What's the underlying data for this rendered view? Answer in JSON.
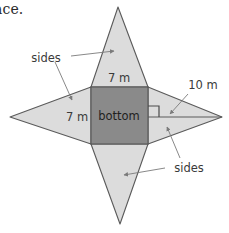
{
  "page": {
    "partial_text_top_left": "ace.",
    "background_color": "#ffffff"
  },
  "figure": {
    "colors": {
      "base_fill": "#8a8a8a",
      "side_fill": "#dcdcdc",
      "outline": "#5a5a5a",
      "leader_line": "#7a7a7a",
      "text": "#3a3a3a"
    },
    "base_label": "bottom",
    "labels": {
      "top_width": "7 m",
      "left_width": "7 m",
      "slant_height": "10 m",
      "sides_top_left": "sides",
      "sides_bottom_right": "sides"
    },
    "right_angle_marker": true
  }
}
